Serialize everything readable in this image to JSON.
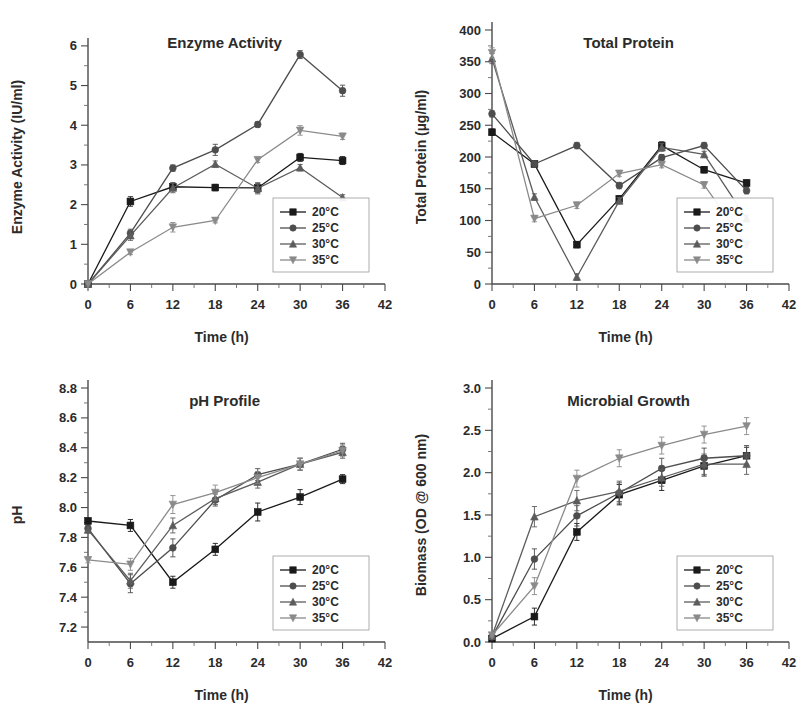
{
  "figure": {
    "background": "#ffffff",
    "series_colors": [
      "#1a1a1a",
      "#4d4d4d",
      "#5c5c5c",
      "#8a8a8a"
    ],
    "axis_color": "#4a4a4a"
  },
  "legend": {
    "entries": [
      {
        "label": "20°C",
        "marker": "square"
      },
      {
        "label": "25°C",
        "marker": "circle"
      },
      {
        "label": "30°C",
        "marker": "triangle-up"
      },
      {
        "label": "35°C",
        "marker": "triangle-down"
      }
    ]
  },
  "chart_data": [
    {
      "type": "line",
      "id": "enzyme-activity",
      "title": "Enzyme Activity",
      "xlabel": "Time (h)",
      "ylabel": "Enzyme Activity (IU/ml)",
      "x": [
        0,
        6,
        12,
        18,
        24,
        30,
        36
      ],
      "xlim": [
        0,
        42
      ],
      "ylim": [
        0,
        6.4
      ],
      "xticks": [
        0,
        6,
        12,
        18,
        24,
        30,
        36,
        42
      ],
      "yticks": [
        0,
        1,
        2,
        3,
        4,
        5,
        6
      ],
      "legend_position": "lower-right",
      "grid": false,
      "series": [
        {
          "name": "20°C",
          "marker": "square",
          "values": [
            0,
            2.08,
            2.45,
            2.43,
            2.42,
            3.19,
            3.11
          ],
          "errors": [
            0,
            0.12,
            0.1,
            0.08,
            0.12,
            0.1,
            0.1
          ]
        },
        {
          "name": "25°C",
          "marker": "circle",
          "values": [
            0,
            1.28,
            2.92,
            3.38,
            4.02,
            5.78,
            4.87
          ],
          "errors": [
            0,
            0.1,
            0.08,
            0.14,
            0.07,
            0.1,
            0.14
          ]
        },
        {
          "name": "30°C",
          "marker": "triangle-up",
          "values": [
            0,
            1.22,
            2.42,
            3.02,
            2.41,
            2.93,
            2.18
          ],
          "errors": [
            0,
            0.12,
            0.12,
            0.08,
            0.14,
            0.08,
            0.07
          ]
        },
        {
          "name": "35°C",
          "marker": "triangle-down",
          "values": [
            0,
            0.8,
            1.43,
            1.6,
            3.13,
            3.87,
            3.72
          ],
          "errors": [
            0,
            0.06,
            0.12,
            0.06,
            0.07,
            0.12,
            0.08
          ]
        }
      ]
    },
    {
      "type": "line",
      "id": "total-protein",
      "title": "Total Protein",
      "xlabel": "Time (h)",
      "ylabel": "Total Protein (µg/ml)",
      "x": [
        0,
        6,
        12,
        18,
        24,
        30,
        36
      ],
      "xlim": [
        0,
        42
      ],
      "ylim": [
        0,
        400
      ],
      "xticks": [
        0,
        6,
        12,
        18,
        24,
        30,
        36,
        42
      ],
      "yticks": [
        0,
        50,
        100,
        150,
        200,
        250,
        300,
        350,
        400
      ],
      "legend_position": "lower-right",
      "grid": false,
      "series": [
        {
          "name": "20°C",
          "marker": "square",
          "values": [
            239,
            189,
            62,
            134,
            218,
            180,
            159
          ],
          "errors": [
            5,
            5,
            5,
            5,
            6,
            5,
            5
          ]
        },
        {
          "name": "25°C",
          "marker": "circle",
          "values": [
            268,
            189,
            218,
            155,
            199,
            218,
            147
          ],
          "errors": [
            5,
            5,
            5,
            5,
            5,
            5,
            5
          ]
        },
        {
          "name": "30°C",
          "marker": "triangle-up",
          "values": [
            355,
            137,
            11,
            131,
            215,
            204,
            103
          ],
          "errors": [
            8,
            5,
            5,
            5,
            6,
            5,
            5
          ]
        },
        {
          "name": "35°C",
          "marker": "triangle-down",
          "values": [
            364,
            103,
            124,
            174,
            188,
            156,
            62
          ],
          "errors": [
            8,
            5,
            5,
            5,
            5,
            5,
            5
          ]
        }
      ]
    },
    {
      "type": "line",
      "id": "ph-profile",
      "title": "pH Profile",
      "xlabel": "Time (h)",
      "ylabel": "pH",
      "x": [
        0,
        6,
        12,
        18,
        24,
        30,
        36
      ],
      "xlim": [
        0,
        42
      ],
      "ylim": [
        7.1,
        8.8
      ],
      "xticks": [
        0,
        6,
        12,
        18,
        24,
        30,
        36,
        42
      ],
      "yticks": [
        7.2,
        7.4,
        7.6,
        7.8,
        8.0,
        8.2,
        8.4,
        8.6,
        8.8
      ],
      "legend_position": "lower-right",
      "grid": false,
      "series": [
        {
          "name": "20°C",
          "marker": "square",
          "values": [
            7.91,
            7.88,
            7.5,
            7.72,
            7.97,
            8.07,
            8.19
          ],
          "errors": [
            0.02,
            0.04,
            0.04,
            0.04,
            0.06,
            0.05,
            0.03
          ]
        },
        {
          "name": "25°C",
          "marker": "circle",
          "values": [
            7.86,
            7.49,
            7.73,
            8.05,
            8.22,
            8.29,
            8.39
          ],
          "errors": [
            0.02,
            0.06,
            0.06,
            0.04,
            0.04,
            0.04,
            0.04
          ]
        },
        {
          "name": "30°C",
          "marker": "triangle-up",
          "values": [
            7.85,
            7.51,
            7.88,
            8.06,
            8.17,
            8.29,
            8.37
          ],
          "errors": [
            0.02,
            0.05,
            0.05,
            0.04,
            0.04,
            0.04,
            0.04
          ]
        },
        {
          "name": "35°C",
          "marker": "triangle-down",
          "values": [
            7.65,
            7.62,
            8.02,
            8.1,
            8.2,
            8.29,
            8.38
          ],
          "errors": [
            0.02,
            0.04,
            0.06,
            0.05,
            0.04,
            0.04,
            0.04
          ]
        }
      ]
    },
    {
      "type": "line",
      "id": "microbial-growth",
      "title": "Microbial Growth",
      "xlabel": "Time (h)",
      "ylabel": "Biomass (OD @ 600 nm)",
      "x": [
        0,
        6,
        12,
        18,
        24,
        30,
        36
      ],
      "xlim": [
        0,
        42
      ],
      "ylim": [
        0,
        3.0
      ],
      "xticks": [
        0,
        6,
        12,
        18,
        24,
        30,
        36,
        42
      ],
      "yticks": [
        0.0,
        0.5,
        1.0,
        1.5,
        2.0,
        2.5,
        3.0
      ],
      "legend_position": "lower-right",
      "grid": false,
      "series": [
        {
          "name": "20°C",
          "marker": "square",
          "values": [
            0.04,
            0.3,
            1.3,
            1.74,
            1.91,
            2.08,
            2.2
          ],
          "errors": [
            0.02,
            0.1,
            0.1,
            0.12,
            0.12,
            0.12,
            0.1
          ]
        },
        {
          "name": "25°C",
          "marker": "circle",
          "values": [
            0.06,
            0.98,
            1.49,
            1.76,
            2.05,
            2.17,
            2.2
          ],
          "errors": [
            0.02,
            0.12,
            0.12,
            0.12,
            0.12,
            0.12,
            0.12
          ]
        },
        {
          "name": "30°C",
          "marker": "triangle-up",
          "values": [
            0.07,
            1.48,
            1.67,
            1.78,
            1.94,
            2.1,
            2.1
          ],
          "errors": [
            0.02,
            0.12,
            0.12,
            0.12,
            0.1,
            0.12,
            0.12
          ]
        },
        {
          "name": "35°C",
          "marker": "triangle-down",
          "values": [
            0.08,
            0.66,
            1.93,
            2.17,
            2.32,
            2.45,
            2.55
          ],
          "errors": [
            0.02,
            0.1,
            0.1,
            0.1,
            0.1,
            0.1,
            0.1
          ]
        }
      ]
    }
  ]
}
